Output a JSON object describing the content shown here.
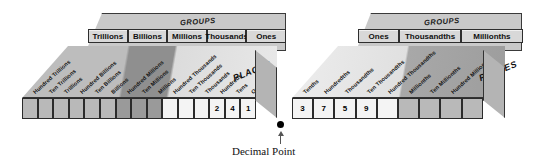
{
  "diagram": {
    "title_caption": "Decimal Point",
    "groups_label": "GROUPS",
    "places_label": "PLACES",
    "decimal_point_glyph": "●"
  },
  "whole_block": {
    "groups_label": "GROUPS",
    "places_label": "PLACES",
    "groups": [
      {
        "label": "Trillions",
        "span": 3
      },
      {
        "label": "Billions",
        "span": 3
      },
      {
        "label": "Millions",
        "span": 3
      },
      {
        "label": "Thousands",
        "span": 3
      },
      {
        "label": "Ones",
        "span": 3
      }
    ],
    "places": [
      "Hundred Trillions",
      "Ten Trillions",
      "Trillions",
      "Hundred Billions",
      "Ten Billions",
      "Billions",
      "Hundred Millions",
      "Ten Millions",
      "Millions",
      "Hundred Thousands",
      "Ten Thousands",
      "Thousands",
      "Hundreds",
      "Tens",
      "Ones"
    ],
    "digits": [
      "",
      "",
      "",
      "",
      "",
      "",
      "",
      "",
      "",
      "",
      "",
      "",
      "2",
      "4",
      "1"
    ],
    "shades": [
      2,
      2,
      2,
      2,
      2,
      2,
      3,
      3,
      3,
      0,
      0,
      0,
      0,
      0,
      0
    ]
  },
  "fraction_block": {
    "groups_label": "GROUPS",
    "places_label": "PLACES",
    "groups": [
      {
        "label": "Ones",
        "span": 2
      },
      {
        "label": "Thousandths",
        "span": 3
      },
      {
        "label": "Millionths",
        "span": 3
      }
    ],
    "places": [
      "Tenths",
      "Hundredths",
      "Thousandths",
      "Ten Thousandths",
      "Hundred Thousandths",
      "Millionths",
      "Ten Millionths",
      "Hundred Millionths"
    ],
    "digits": [
      "3",
      "7",
      "5",
      "9",
      "",
      "",
      "",
      "",
      ""
    ],
    "shades": [
      0,
      0,
      0,
      0,
      0,
      2,
      2,
      2,
      2
    ]
  },
  "colors": {
    "slab_top": "#c9c9c9",
    "group_cell": "#d8d8d8",
    "cell_light": "#f4f4f4",
    "cell_mid": "#b9b9b9",
    "cell_dark": "#9a9a9a",
    "ink": "#111111"
  }
}
